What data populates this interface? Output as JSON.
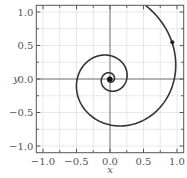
{
  "chart_data": {
    "type": "line",
    "title": "",
    "xlabel": "x",
    "ylabel": "y",
    "xlim": [
      -1.1,
      1.1
    ],
    "ylim": [
      -1.1,
      1.1
    ],
    "xticks": [
      -1.0,
      -0.5,
      0.0,
      0.5,
      1.0
    ],
    "yticks": [
      -1.0,
      -0.5,
      0.0,
      0.5,
      1.0
    ],
    "xtick_labels": [
      "−1.0",
      "−0.5",
      "0.0",
      "0.5",
      "1.0"
    ],
    "ytick_labels": [
      "1.0",
      "0.5",
      "0.0",
      "−0.5",
      "−1.0"
    ],
    "grid": true,
    "minor_grid_step": 0.25,
    "legend": null,
    "series": [
      {
        "name": "logarithmic spiral",
        "equation": "r = 0.25 * exp(0.214 * theta)",
        "theta_range": [
          -12.0,
          7.4
        ],
        "color": "#333333",
        "points_sample": [
          [
            0.25,
            0.0
          ],
          [
            0.0,
            0.35
          ],
          [
            -0.49,
            0.0
          ],
          [
            0.0,
            -0.69
          ],
          [
            0.97,
            0.0
          ],
          [
            0.93,
            0.55
          ],
          [
            0.6,
            1.0
          ]
        ]
      }
    ],
    "markers": [
      {
        "x": 0.93,
        "y": 0.55,
        "label": ""
      },
      {
        "x": 0.0,
        "y": 0.0,
        "label": ""
      }
    ]
  },
  "axes": {
    "x_label": "x",
    "y_label": "y"
  }
}
